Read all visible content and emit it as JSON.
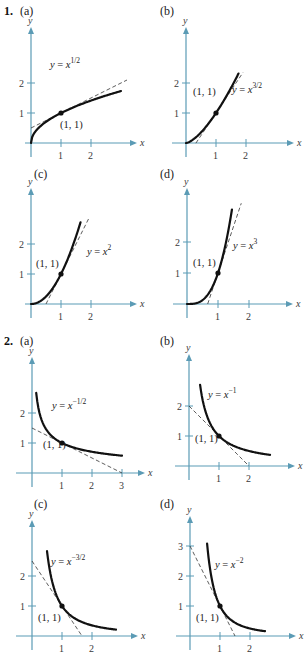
{
  "problems": [
    {
      "number": "1.",
      "panels": [
        {
          "label": "(a)",
          "equation": {
            "lhs": "y",
            "base": "x",
            "exp": "1/2"
          },
          "point_label": "(1, 1)"
        },
        {
          "label": "(b)",
          "equation": {
            "lhs": "y",
            "base": "x",
            "exp": "3/2"
          },
          "point_label": "(1, 1)"
        },
        {
          "label": "(c)",
          "equation": {
            "lhs": "y",
            "base": "x",
            "exp": "2"
          },
          "point_label": "(1, 1)"
        },
        {
          "label": "(d)",
          "equation": {
            "lhs": "y",
            "base": "x",
            "exp": "3"
          },
          "point_label": "(1, 1)"
        }
      ]
    },
    {
      "number": "2.",
      "panels": [
        {
          "label": "(a)",
          "equation": {
            "lhs": "y",
            "base": "x",
            "exp": "−1/2"
          },
          "point_label": "(1, 1)"
        },
        {
          "label": "(b)",
          "equation": {
            "lhs": "y",
            "base": "x",
            "exp": "−1"
          },
          "point_label": "(1, 1)"
        },
        {
          "label": "(c)",
          "equation": {
            "lhs": "y",
            "base": "x",
            "exp": "−3/2"
          },
          "point_label": "(1, 1)"
        },
        {
          "label": "(d)",
          "equation": {
            "lhs": "y",
            "base": "x",
            "exp": "−2"
          },
          "point_label": "(1, 1)"
        }
      ]
    }
  ],
  "chart_data": [
    {
      "id": "1a",
      "type": "line",
      "title": "1. (a)",
      "xlabel": "x",
      "ylabel": "y",
      "function": "y = x^(1/2)",
      "power": 0.5,
      "curve_x_range": [
        0,
        3
      ],
      "tangent": {
        "at": [
          1,
          1
        ],
        "slope": 0.5,
        "intercept": 0.5,
        "x_range": [
          0,
          3.2
        ]
      },
      "point": [
        1,
        1
      ],
      "xticks": [
        1,
        2
      ],
      "yticks": [
        1,
        2
      ],
      "xlim": [
        0,
        3.2
      ],
      "ylim": [
        0,
        3
      ],
      "grid": false
    },
    {
      "id": "1b",
      "type": "line",
      "title": "1. (b)",
      "xlabel": "x",
      "ylabel": "y",
      "function": "y = x^(3/2)",
      "power": 1.5,
      "curve_x_range": [
        0,
        1.75
      ],
      "tangent": {
        "at": [
          1,
          1
        ],
        "slope": 1.5,
        "intercept": -0.5,
        "x_range": [
          0.33,
          1.9
        ]
      },
      "point": [
        1,
        1
      ],
      "xticks": [
        1,
        2
      ],
      "yticks": [
        1,
        2
      ],
      "xlim": [
        0,
        3
      ],
      "ylim": [
        0,
        3
      ],
      "grid": false
    },
    {
      "id": "1c",
      "type": "line",
      "title": "1. (c)",
      "xlabel": "x",
      "ylabel": "y",
      "function": "y = x^2",
      "power": 2,
      "curve_x_range": [
        0,
        1.65
      ],
      "tangent": {
        "at": [
          1,
          1
        ],
        "slope": 2,
        "intercept": -1,
        "x_range": [
          0.5,
          1.95
        ]
      },
      "point": [
        1,
        1
      ],
      "xticks": [
        1,
        2
      ],
      "yticks": [
        1,
        2
      ],
      "xlim": [
        0,
        3
      ],
      "ylim": [
        0,
        3
      ],
      "grid": false
    },
    {
      "id": "1d",
      "type": "line",
      "title": "1. (d)",
      "xlabel": "x",
      "ylabel": "y",
      "function": "y = x^3",
      "power": 3,
      "curve_x_range": [
        0,
        1.45
      ],
      "tangent": {
        "at": [
          1,
          1
        ],
        "slope": 3,
        "intercept": -2,
        "x_range": [
          0.667,
          1.75
        ]
      },
      "point": [
        1,
        1
      ],
      "xticks": [
        1,
        2
      ],
      "yticks": [
        1,
        2
      ],
      "xlim": [
        0,
        3
      ],
      "ylim": [
        0,
        3
      ],
      "grid": false
    },
    {
      "id": "2a",
      "type": "line",
      "title": "2. (a)",
      "xlabel": "x",
      "ylabel": "y",
      "function": "y = x^(-1/2)",
      "power": -0.5,
      "curve_x_range": [
        0.14,
        3
      ],
      "tangent": {
        "at": [
          1,
          1
        ],
        "slope": -0.5,
        "intercept": 1.5,
        "x_range": [
          0,
          3
        ]
      },
      "point": [
        1,
        1
      ],
      "xticks": [
        1,
        2,
        3
      ],
      "yticks": [
        1,
        2
      ],
      "xlim": [
        0,
        3.3
      ],
      "ylim": [
        0,
        3
      ],
      "grid": false
    },
    {
      "id": "2b",
      "type": "line",
      "title": "2. (b)",
      "xlabel": "x",
      "ylabel": "y",
      "function": "y = x^(-1)",
      "power": -1,
      "curve_x_range": [
        0.37,
        2.7
      ],
      "tangent": {
        "at": [
          1,
          1
        ],
        "slope": -1,
        "intercept": 2,
        "x_range": [
          0,
          2
        ]
      },
      "point": [
        1,
        1
      ],
      "xticks": [
        1,
        2
      ],
      "yticks": [
        1,
        2
      ],
      "xlim": [
        0,
        3
      ],
      "ylim": [
        0,
        3
      ],
      "grid": false
    },
    {
      "id": "2c",
      "type": "line",
      "title": "2. (c)",
      "xlabel": "x",
      "ylabel": "y",
      "function": "y = x^(-3/2)",
      "power": -1.5,
      "curve_x_range": [
        0.5,
        2.8
      ],
      "tangent": {
        "at": [
          1,
          1
        ],
        "slope": -1.5,
        "intercept": 2.5,
        "x_range": [
          0,
          1.667
        ]
      },
      "point": [
        1,
        1
      ],
      "xticks": [
        1,
        2
      ],
      "yticks": [
        1,
        2
      ],
      "xlim": [
        0,
        3
      ],
      "ylim": [
        0,
        3
      ],
      "grid": false
    },
    {
      "id": "2d",
      "type": "line",
      "title": "2. (d)",
      "xlabel": "x",
      "ylabel": "y",
      "function": "y = x^(-2)",
      "power": -2,
      "curve_x_range": [
        0.57,
        2.5
      ],
      "tangent": {
        "at": [
          1,
          1
        ],
        "slope": -2,
        "intercept": 3,
        "x_range": [
          0,
          1.5
        ]
      },
      "point": [
        1,
        1
      ],
      "xticks": [
        1,
        2
      ],
      "yticks": [
        1,
        2,
        3
      ],
      "xlim": [
        0,
        3
      ],
      "ylim": [
        0,
        3.3
      ],
      "grid": false
    }
  ],
  "colors": {
    "axis": "#5b9bb5",
    "curve": "#111111",
    "tangent": "#333333",
    "text": "#222222"
  }
}
